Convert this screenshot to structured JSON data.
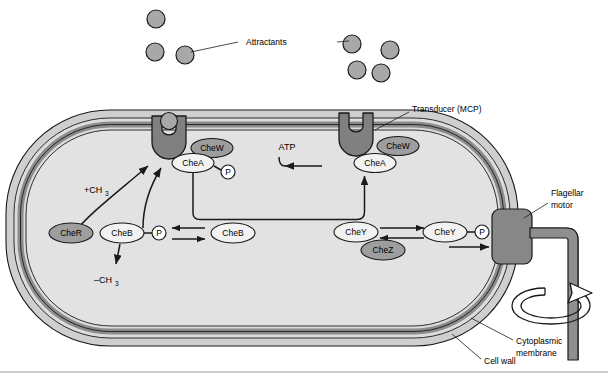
{
  "figure": {
    "background_color": "#ffffff"
  },
  "colors": {
    "cytoplasm": "#e2e2e2",
    "cell_wall": "#cfcfcf",
    "membrane_dark": "#8c8c8c",
    "transducer_fill": "#808080",
    "attractant_fill": "#a8a8a8",
    "protein_fill_light": "#f2f2f2",
    "protein_fill_dark": "#9e9e9e",
    "motor_fill": "#878787",
    "flagellum_fill": "#8f8f8f",
    "stroke": "#1a1a1a"
  },
  "labels": {
    "attractants": "Attractants",
    "transducer": "Transducer (MCP)",
    "flagellar_motor_line1": "Flagellar",
    "flagellar_motor_line2": "motor",
    "cytoplasmic_membrane_line1": "Cytoplasmic",
    "cytoplasmic_membrane_line2": "membrane",
    "cell_wall": "Cell wall",
    "atp": "ATP",
    "methyl_add": "+CH",
    "methyl_add_sub": "3",
    "methyl_remove": "–CH",
    "methyl_remove_sub": "3"
  },
  "proteins": {
    "chew_left": "CheW",
    "chea_left": "CheA",
    "chew_right": "CheW",
    "chea_right": "CheA",
    "cher": "CheR",
    "cheb": "CheB",
    "cheb_unphos": "CheB",
    "chey_left": "CheY",
    "chey_right": "CheY",
    "chez": "CheZ",
    "phosphate": "P"
  },
  "structures": {
    "attractants_left_count": 3,
    "attractants_right_count": 4,
    "transducer_count": 2,
    "transducer_left_occupied": true,
    "transducer_right_occupied": false
  }
}
